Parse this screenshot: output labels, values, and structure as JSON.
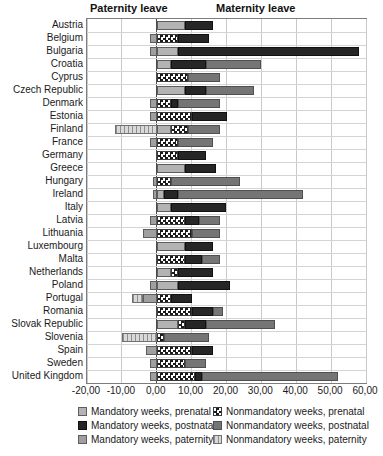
{
  "header": {
    "paternity_label": "Paternity leave",
    "maternity_label": "Maternity leave"
  },
  "colors": {
    "prenatal_mandatory": "#b3b3b3",
    "postnatal_mandatory": "#262626",
    "paternity_mandatory": "#9f9f9f",
    "prenatal_nonmandatory_checker": "#1b1b1b",
    "postnatal_nonmandatory": "#757575",
    "paternity_nonmandatory_stripe": "#8e8e8e",
    "zero_axis": "#4b4b4b",
    "gridline": "#c9c9c9"
  },
  "chart_data": {
    "type": "bar",
    "orientation": "horizontal",
    "stacked": true,
    "unit": "weeks",
    "xlim": [
      -20,
      60
    ],
    "grid": true,
    "x_ticks": [
      {
        "value": -20,
        "label": "-20,00"
      },
      {
        "value": -10,
        "label": "-10,00"
      },
      {
        "value": 0,
        "label": "0,00"
      },
      {
        "value": 10,
        "label": "10,00"
      },
      {
        "value": 20,
        "label": "20,00"
      },
      {
        "value": 30,
        "label": "30,00"
      },
      {
        "value": 40,
        "label": "40,00"
      },
      {
        "value": 50,
        "label": "50,00"
      },
      {
        "value": 60,
        "label": "60,00"
      }
    ],
    "stack_order": [
      "paternity_nonmandatory",
      "paternity_mandatory",
      "prenatal_mandatory",
      "prenatal_nonmandatory",
      "postnatal_mandatory",
      "postnatal_nonmandatory"
    ],
    "countries": [
      {
        "name": "Austria",
        "paternity_nonmandatory": 0,
        "paternity_mandatory": 0,
        "prenatal_mandatory": 8,
        "prenatal_nonmandatory": 0,
        "postnatal_mandatory": 8,
        "postnatal_nonmandatory": 0
      },
      {
        "name": "Belgium",
        "paternity_nonmandatory": 0,
        "paternity_mandatory": 2,
        "prenatal_mandatory": 0,
        "prenatal_nonmandatory": 6,
        "postnatal_mandatory": 9,
        "postnatal_nonmandatory": 0
      },
      {
        "name": "Bulgaria",
        "paternity_nonmandatory": 0,
        "paternity_mandatory": 2,
        "prenatal_mandatory": 6,
        "prenatal_nonmandatory": 0,
        "postnatal_mandatory": 52,
        "postnatal_nonmandatory": 0
      },
      {
        "name": "Croatia",
        "paternity_nonmandatory": 0,
        "paternity_mandatory": 0,
        "prenatal_mandatory": 4,
        "prenatal_nonmandatory": 0,
        "postnatal_mandatory": 10,
        "postnatal_nonmandatory": 16
      },
      {
        "name": "Cyprus",
        "paternity_nonmandatory": 0,
        "paternity_mandatory": 0,
        "prenatal_mandatory": 0,
        "prenatal_nonmandatory": 9,
        "postnatal_mandatory": 0,
        "postnatal_nonmandatory": 9
      },
      {
        "name": "Czech Republic",
        "paternity_nonmandatory": 0,
        "paternity_mandatory": 0,
        "prenatal_mandatory": 8,
        "prenatal_nonmandatory": 0,
        "postnatal_mandatory": 6,
        "postnatal_nonmandatory": 14
      },
      {
        "name": "Denmark",
        "paternity_nonmandatory": 0,
        "paternity_mandatory": 2,
        "prenatal_mandatory": 0,
        "prenatal_nonmandatory": 4,
        "postnatal_mandatory": 2,
        "postnatal_nonmandatory": 12
      },
      {
        "name": "Estonia",
        "paternity_nonmandatory": 0,
        "paternity_mandatory": 2,
        "prenatal_mandatory": 0,
        "prenatal_nonmandatory": 10,
        "postnatal_mandatory": 10,
        "postnatal_nonmandatory": 0
      },
      {
        "name": "Finland",
        "paternity_nonmandatory": 12,
        "paternity_mandatory": 0,
        "prenatal_mandatory": 4,
        "prenatal_nonmandatory": 5,
        "postnatal_mandatory": 0,
        "postnatal_nonmandatory": 9
      },
      {
        "name": "France",
        "paternity_nonmandatory": 0,
        "paternity_mandatory": 2,
        "prenatal_mandatory": 0,
        "prenatal_nonmandatory": 6,
        "postnatal_mandatory": 0,
        "postnatal_nonmandatory": 10
      },
      {
        "name": "Germany",
        "paternity_nonmandatory": 0,
        "paternity_mandatory": 0,
        "prenatal_mandatory": 0,
        "prenatal_nonmandatory": 6,
        "postnatal_mandatory": 8,
        "postnatal_nonmandatory": 0
      },
      {
        "name": "Greece",
        "paternity_nonmandatory": 0,
        "paternity_mandatory": 0,
        "prenatal_mandatory": 8,
        "prenatal_nonmandatory": 0,
        "postnatal_mandatory": 9,
        "postnatal_nonmandatory": 0
      },
      {
        "name": "Hungary",
        "paternity_nonmandatory": 0,
        "paternity_mandatory": 1,
        "prenatal_mandatory": 0,
        "prenatal_nonmandatory": 4,
        "postnatal_mandatory": 0,
        "postnatal_nonmandatory": 20
      },
      {
        "name": "Ireland",
        "paternity_nonmandatory": 0,
        "paternity_mandatory": 1,
        "prenatal_mandatory": 2,
        "prenatal_nonmandatory": 0,
        "postnatal_mandatory": 4,
        "postnatal_nonmandatory": 36
      },
      {
        "name": "Italy",
        "paternity_nonmandatory": 0,
        "paternity_mandatory": 0,
        "prenatal_mandatory": 4,
        "prenatal_nonmandatory": 0,
        "postnatal_mandatory": 16,
        "postnatal_nonmandatory": 0
      },
      {
        "name": "Latvia",
        "paternity_nonmandatory": 0,
        "paternity_mandatory": 2,
        "prenatal_mandatory": 0,
        "prenatal_nonmandatory": 8,
        "postnatal_mandatory": 4,
        "postnatal_nonmandatory": 6
      },
      {
        "name": "Lithuania",
        "paternity_nonmandatory": 0,
        "paternity_mandatory": 4,
        "prenatal_mandatory": 0,
        "prenatal_nonmandatory": 10,
        "postnatal_mandatory": 0,
        "postnatal_nonmandatory": 8
      },
      {
        "name": "Luxembourg",
        "paternity_nonmandatory": 0,
        "paternity_mandatory": 0,
        "prenatal_mandatory": 8,
        "prenatal_nonmandatory": 0,
        "postnatal_mandatory": 8,
        "postnatal_nonmandatory": 0
      },
      {
        "name": "Malta",
        "paternity_nonmandatory": 0,
        "paternity_mandatory": 0,
        "prenatal_mandatory": 0,
        "prenatal_nonmandatory": 8,
        "postnatal_mandatory": 5,
        "postnatal_nonmandatory": 5
      },
      {
        "name": "Netherlands",
        "paternity_nonmandatory": 0,
        "paternity_mandatory": 0,
        "prenatal_mandatory": 4,
        "prenatal_nonmandatory": 2,
        "postnatal_mandatory": 10,
        "postnatal_nonmandatory": 0
      },
      {
        "name": "Poland",
        "paternity_nonmandatory": 0,
        "paternity_mandatory": 2,
        "prenatal_mandatory": 6,
        "prenatal_nonmandatory": 0,
        "postnatal_mandatory": 15,
        "postnatal_nonmandatory": 0
      },
      {
        "name": "Portugal",
        "paternity_nonmandatory": 3,
        "paternity_mandatory": 4,
        "prenatal_mandatory": 0,
        "prenatal_nonmandatory": 4,
        "postnatal_mandatory": 6,
        "postnatal_nonmandatory": 0
      },
      {
        "name": "Romania",
        "paternity_nonmandatory": 0,
        "paternity_mandatory": 0,
        "prenatal_mandatory": 0,
        "prenatal_nonmandatory": 10,
        "postnatal_mandatory": 6,
        "postnatal_nonmandatory": 3
      },
      {
        "name": "Slovak Republic",
        "paternity_nonmandatory": 0,
        "paternity_mandatory": 0,
        "prenatal_mandatory": 6,
        "prenatal_nonmandatory": 2,
        "postnatal_mandatory": 6,
        "postnatal_nonmandatory": 20
      },
      {
        "name": "Slovenia",
        "paternity_nonmandatory": 10,
        "paternity_mandatory": 0,
        "prenatal_mandatory": 0,
        "prenatal_nonmandatory": 2,
        "postnatal_mandatory": 0,
        "postnatal_nonmandatory": 13
      },
      {
        "name": "Spain",
        "paternity_nonmandatory": 0,
        "paternity_mandatory": 3,
        "prenatal_mandatory": 0,
        "prenatal_nonmandatory": 10,
        "postnatal_mandatory": 6,
        "postnatal_nonmandatory": 0
      },
      {
        "name": "Sweden",
        "paternity_nonmandatory": 0,
        "paternity_mandatory": 2,
        "prenatal_mandatory": 0,
        "prenatal_nonmandatory": 8,
        "postnatal_mandatory": 0,
        "postnatal_nonmandatory": 6
      },
      {
        "name": "United Kingdom",
        "paternity_nonmandatory": 0,
        "paternity_mandatory": 2,
        "prenatal_mandatory": 0,
        "prenatal_nonmandatory": 11,
        "postnatal_mandatory": 2,
        "postnatal_nonmandatory": 39
      }
    ],
    "legend": [
      {
        "label": "Mandatory weeks, prenatal",
        "type": "prenatal_mandatory"
      },
      {
        "label": "Mandatory weeks, postnatal",
        "type": "postnatal_mandatory"
      },
      {
        "label": "Mandatory weeks, paternity",
        "type": "paternity_mandatory"
      },
      {
        "label": "Nonmandatory weeks, prenatal",
        "type": "prenatal_nonmandatory"
      },
      {
        "label": "Nonmandatory weeks, postnatal",
        "type": "postnatal_nonmandatory"
      },
      {
        "label": "Nonmandatory weeks, paternity",
        "type": "paternity_nonmandatory"
      }
    ],
    "legend_position": "bottom"
  }
}
